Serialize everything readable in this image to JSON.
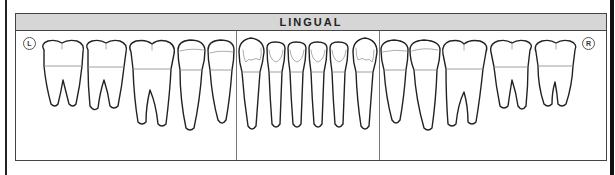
{
  "chart": {
    "title": "LINGUAL",
    "left_marker": "L",
    "right_marker": "R",
    "view": "lingual",
    "tooth_count": 16,
    "teeth": [
      {
        "position": 1,
        "type": "molar",
        "roots": 2
      },
      {
        "position": 2,
        "type": "molar",
        "roots": 2
      },
      {
        "position": 3,
        "type": "molar",
        "roots": 2
      },
      {
        "position": 4,
        "type": "premolar",
        "roots": 1
      },
      {
        "position": 5,
        "type": "premolar",
        "roots": 1
      },
      {
        "position": 6,
        "type": "canine",
        "roots": 1
      },
      {
        "position": 7,
        "type": "incisor",
        "roots": 1
      },
      {
        "position": 8,
        "type": "incisor",
        "roots": 1
      },
      {
        "position": 9,
        "type": "incisor",
        "roots": 1
      },
      {
        "position": 10,
        "type": "incisor",
        "roots": 1
      },
      {
        "position": 11,
        "type": "canine",
        "roots": 1
      },
      {
        "position": 12,
        "type": "premolar",
        "roots": 1
      },
      {
        "position": 13,
        "type": "premolar",
        "roots": 1
      },
      {
        "position": 14,
        "type": "molar",
        "roots": 2
      },
      {
        "position": 15,
        "type": "molar",
        "roots": 2
      },
      {
        "position": 16,
        "type": "molar",
        "roots": 2
      }
    ]
  },
  "colors": {
    "header_bg": "#d6d6d6",
    "outline": "#222222",
    "divider": "#777777"
  }
}
